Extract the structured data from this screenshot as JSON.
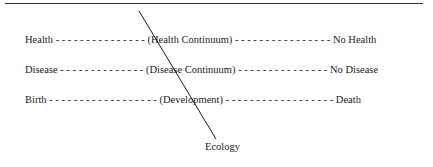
{
  "diagram": {
    "rows": [
      {
        "left": "Health",
        "dashes_left": " - - - - - - - - - - - - - - - ",
        "center": "(Health Continuum)",
        "dashes_right": " - - - - - - - - - - - - - - - - ",
        "right": "No Health"
      },
      {
        "left": "Disease",
        "dashes_left": " - - - - - - - - - - - - - - ",
        "center": "(Disease Continuum)",
        "dashes_right": " - - - - - - - - - - - - - - - ",
        "right": "No Disease"
      },
      {
        "left": "Birth",
        "dashes_left": " - - - - - - - - - - - - - - - - - - ",
        "center": "(Development)",
        "dashes_right": " - - - - - - - - - - - - - - - - - - ",
        "right": "Death"
      }
    ],
    "axis_label": "Ecology",
    "line_color": "#1a1a1a"
  }
}
